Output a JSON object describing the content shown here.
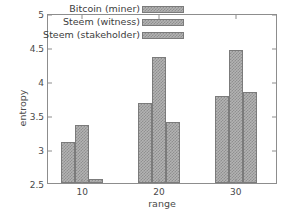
{
  "chart_data": {
    "type": "bar",
    "title": "",
    "xlabel": "range",
    "ylabel": "entropy",
    "categories": [
      "10",
      "20",
      "30"
    ],
    "series": [
      {
        "name": "Bitcoin (miner)",
        "values": [
          3.1,
          3.68,
          3.78
        ]
      },
      {
        "name": "Steem (witness)",
        "values": [
          3.35,
          4.36,
          4.46
        ]
      },
      {
        "name": "Steem (stakeholder)",
        "values": [
          2.56,
          3.4,
          3.84
        ]
      }
    ],
    "ylim": [
      2.5,
      5.0
    ],
    "yticks": [
      "2.5",
      "3",
      "3.5",
      "4",
      "4.5",
      "5"
    ],
    "ytick_values": [
      2.5,
      3.0,
      3.5,
      4.0,
      4.5,
      5.0
    ],
    "xticks": [
      "10",
      "20",
      "30"
    ],
    "grid": false,
    "legend_position": "upper-left",
    "bar_fill_color": "#b3b3b3",
    "bar_edge_color": "#7b7b7b",
    "axis_color": "#8d8d8d",
    "text_color": "#4a4a4a"
  },
  "legend": {
    "entries": [
      {
        "label": "Bitcoin (miner)"
      },
      {
        "label": "Steem (witness)"
      },
      {
        "label": "Steem (stakeholder)"
      }
    ]
  },
  "axes": {
    "y_label": "entropy",
    "x_label": "range"
  }
}
